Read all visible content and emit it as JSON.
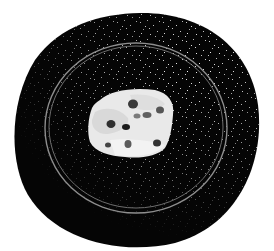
{
  "image": {
    "description": "Grayscale illustration of a petri dish on a black disc with a pale blob containing dark spots",
    "background_color": "#ffffff",
    "disc_color": "#050505",
    "speckle_color": "#e8e8e8",
    "ring_color": "#9a9a9a",
    "blob_color": "#e6e6e6",
    "blob_shade_color": "#cfcfcf",
    "spot_colors": [
      "#2a2a2a",
      "#555555",
      "#7a7a7a"
    ]
  }
}
